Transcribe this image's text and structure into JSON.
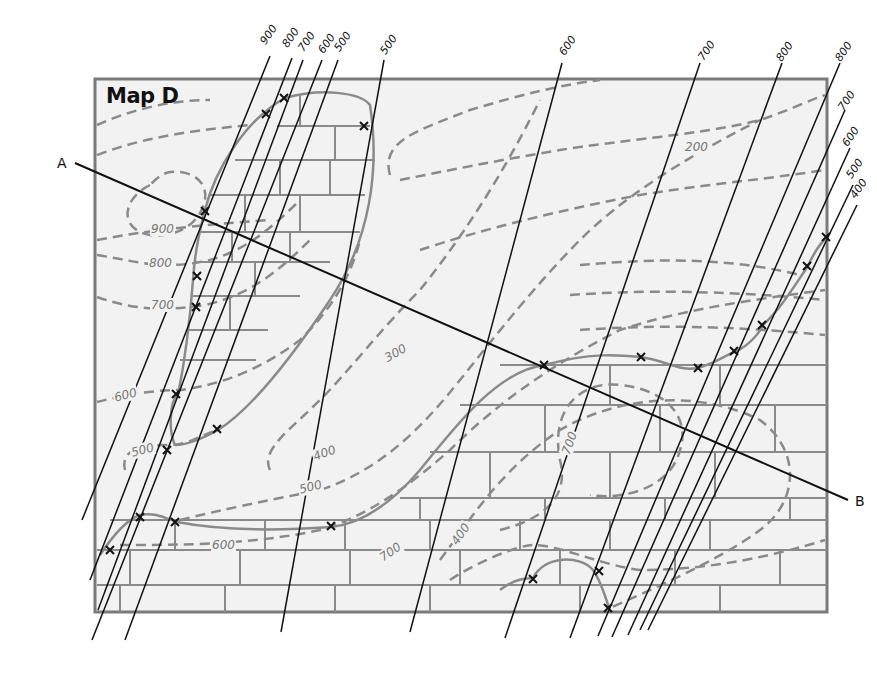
{
  "title": "Map D",
  "colors": {
    "map_fill": "#f2f2f2",
    "map_border": "#7a7a7a",
    "brick_lines": "#8a8a8a",
    "contour": "#8a8a8a",
    "outcrop_boundary": "#8a8a8a",
    "strike_lines": "#111111",
    "section_line": "#111111"
  },
  "cross_section": {
    "start_label": "A",
    "end_label": "B"
  },
  "contour_labels": [
    {
      "text": "900",
      "x": 150,
      "y": 228
    },
    {
      "text": "800",
      "x": 148,
      "y": 262
    },
    {
      "text": "700",
      "x": 150,
      "y": 303
    },
    {
      "text": "600",
      "x": 115,
      "y": 393
    },
    {
      "text": "500",
      "x": 132,
      "y": 448
    },
    {
      "text": "300",
      "x": 383,
      "y": 352
    },
    {
      "text": "400",
      "x": 314,
      "y": 452
    },
    {
      "text": "500",
      "x": 300,
      "y": 486
    },
    {
      "text": "600",
      "x": 211,
      "y": 543
    },
    {
      "text": "200",
      "x": 684,
      "y": 145
    },
    {
      "text": "700",
      "x": 560,
      "y": 440
    },
    {
      "text": "700",
      "x": 381,
      "y": 549
    },
    {
      "text": "400",
      "x": 450,
      "y": 531
    }
  ],
  "strike_line_labels_top_left": [
    "900",
    "800",
    "700",
    "600",
    "500"
  ],
  "strike_line_labels_top": [
    "500",
    "600",
    "700",
    "800",
    "800"
  ],
  "strike_line_labels_right": [
    "700",
    "600",
    "500",
    "400"
  ],
  "strike_labels": [
    {
      "text": "900",
      "x": 268,
      "y": 46
    },
    {
      "text": "800",
      "x": 290,
      "y": 49
    },
    {
      "text": "700",
      "x": 306,
      "y": 53
    },
    {
      "text": "600",
      "x": 326,
      "y": 55
    },
    {
      "text": "500",
      "x": 342,
      "y": 53
    },
    {
      "text": "500",
      "x": 388,
      "y": 56
    },
    {
      "text": "600",
      "x": 567,
      "y": 57
    },
    {
      "text": "700",
      "x": 706,
      "y": 62
    },
    {
      "text": "800",
      "x": 784,
      "y": 63
    },
    {
      "text": "800",
      "x": 843,
      "y": 63
    },
    {
      "text": "700",
      "x": 846,
      "y": 112
    },
    {
      "text": "600",
      "x": 850,
      "y": 148
    },
    {
      "text": "500",
      "x": 854,
      "y": 180
    },
    {
      "text": "400",
      "x": 858,
      "y": 200
    }
  ]
}
